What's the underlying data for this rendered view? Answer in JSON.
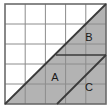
{
  "figure": {
    "kind": "geometry-grid-diagram",
    "grid": {
      "columns": 5,
      "rows": 5,
      "cell_size_px": 20,
      "origin_x": 5,
      "origin_y": 4,
      "width": 101,
      "height": 100,
      "line_color": "#8c8c8c",
      "border_color": "#6b6b6b",
      "background_color": "#ffffff"
    },
    "shading": {
      "fill_color": "#b3b3b3",
      "stroke_color": "#3a3a3a"
    },
    "lines": [
      {
        "name": "main-diagonal",
        "x1": 5,
        "y1": 104,
        "x2": 106,
        "y2": 4
      },
      {
        "name": "parallel-diagonal",
        "x1": 57,
        "y1": 104,
        "x2": 106,
        "y2": 55
      },
      {
        "name": "horizontal-divider",
        "x1": 56,
        "y1": 55,
        "x2": 106,
        "y2": 55
      }
    ],
    "labels": [
      {
        "id": "A",
        "text": "A",
        "x": 55,
        "y": 78
      },
      {
        "id": "B",
        "text": "B",
        "x": 89,
        "y": 38
      },
      {
        "id": "C",
        "text": "C",
        "x": 89,
        "y": 88
      }
    ]
  }
}
